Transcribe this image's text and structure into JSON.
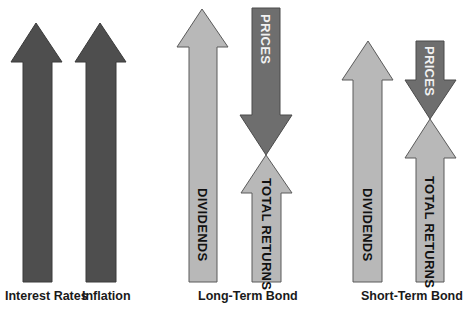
{
  "groups": [
    {
      "caption": "Interest Rates",
      "arrows": [
        {
          "direction": "up",
          "label": "",
          "shade": "dark"
        }
      ]
    },
    {
      "caption": "Inflation",
      "arrows": [
        {
          "direction": "up",
          "label": "",
          "shade": "dark"
        }
      ]
    },
    {
      "caption": "Long-Term Bond",
      "arrows": [
        {
          "direction": "up",
          "label": "DIVIDENDS",
          "shade": "light"
        },
        {
          "direction": "down",
          "label": "PRICES",
          "shade": "mid"
        },
        {
          "direction": "up",
          "label": "TOTAL RETURNS",
          "shade": "light"
        }
      ]
    },
    {
      "caption": "Short-Term Bond",
      "arrows": [
        {
          "direction": "up",
          "label": "DIVIDENDS",
          "shade": "light"
        },
        {
          "direction": "down",
          "label": "PRICES",
          "shade": "mid"
        },
        {
          "direction": "up",
          "label": "TOTAL RETURNS",
          "shade": "light"
        }
      ]
    }
  ],
  "colors": {
    "dark_arrow": "#4e4e4e",
    "light_arrow": "#b8b8b8",
    "mid_arrow": "#6e6e6e",
    "background": "#ffffff"
  }
}
